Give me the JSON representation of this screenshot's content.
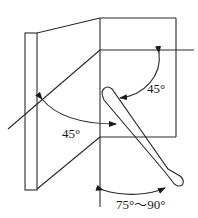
{
  "diagram": {
    "type": "technical-drawing",
    "stroke_color": "#2a2a2a",
    "background": "#ffffff",
    "labels": {
      "upper_angle": "45°",
      "lower_angle": "45°",
      "bottom_angle": "75°～90°"
    }
  }
}
